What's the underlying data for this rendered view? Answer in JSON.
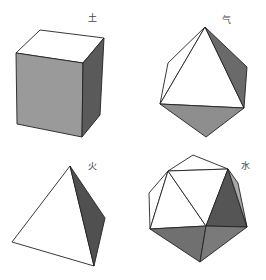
{
  "diagram": {
    "solids": [
      {
        "id": "cube",
        "label": "土",
        "label_pos": [
          88,
          14
        ],
        "faces": [
          {
            "name": "top-face",
            "points": "16,53 40,30 104,38 83,63",
            "fill": "#ffffff"
          },
          {
            "name": "front-face",
            "points": "16,53 83,63 82,137 17,124",
            "fill": "#9a9a9a"
          },
          {
            "name": "right-face",
            "points": "83,63 104,38 100,115 82,137",
            "fill": "#5a5a5a"
          }
        ]
      },
      {
        "id": "octahedron",
        "label": "气",
        "label_pos": [
          222,
          16
        ],
        "faces": [
          {
            "name": "back-left-face",
            "points": "205,27 168,63 160,104",
            "fill": "#ffffff"
          },
          {
            "name": "front-face",
            "points": "205,27 160,104 244,108",
            "fill": "#ffffff"
          },
          {
            "name": "right-face",
            "points": "205,27 247,67 244,108",
            "fill": "#6a6a6a"
          },
          {
            "name": "bottom-face",
            "points": "160,104 244,108 206,137",
            "fill": "#8e8e8e"
          }
        ]
      },
      {
        "id": "tetrahedron",
        "label": "火",
        "label_pos": [
          88,
          162
        ],
        "faces": [
          {
            "name": "front-face",
            "points": "70,166 12,242 94,266",
            "fill": "#ffffff"
          },
          {
            "name": "right-face",
            "points": "70,166 105,218 94,266",
            "fill": "#505050"
          }
        ]
      },
      {
        "id": "icosahedron",
        "label": "水",
        "label_pos": [
          241,
          162
        ],
        "faces": [
          {
            "name": "top-face",
            "points": "168,171 193,155 228,169",
            "fill": "#ffffff"
          },
          {
            "name": "upper-left-face",
            "points": "149,193 168,171 150,229",
            "fill": "#ffffff"
          },
          {
            "name": "left-face",
            "points": "168,171 150,229 206,226",
            "fill": "#ffffff"
          },
          {
            "name": "center-face",
            "points": "168,171 228,169 206,226",
            "fill": "#ffffff"
          },
          {
            "name": "right-dark-face",
            "points": "228,169 206,226 247,227",
            "fill": "#555555"
          },
          {
            "name": "right-sliver-face",
            "points": "228,169 238,183 247,227",
            "fill": "#a8a8a8"
          },
          {
            "name": "bottom-left-face",
            "points": "150,229 206,226 200,262",
            "fill": "#707070"
          },
          {
            "name": "bottom-right-face",
            "points": "206,226 247,227 200,262",
            "fill": "#7a7a7a"
          }
        ]
      }
    ],
    "stroke_color": "#222222",
    "background": "#ffffff"
  }
}
